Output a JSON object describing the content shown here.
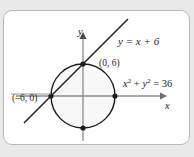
{
  "figure": {
    "kind": "coordinate-plane-diagram",
    "background_color": "#e9e9e9",
    "card_color": "#ffffff",
    "card_border_color": "#b9b9b9",
    "ink_color": "#1c1c1c",
    "axis_color": "#8a8a8a",
    "circle_fill": "#f7f7f7",
    "axes": {
      "x_label": "x",
      "y_label": "y"
    },
    "labels": {
      "line_equation": "y = x + 6",
      "circle_equation_base": "x",
      "circle_equation": "x² + y² = 36",
      "point_top": "(0, 6)",
      "point_left": "(–6, 0)"
    }
  },
  "chart_data": {
    "type": "scatter",
    "title": "",
    "xlabel": "x",
    "ylabel": "y",
    "xlim": [
      -10,
      10
    ],
    "ylim": [
      -9,
      9
    ],
    "grid": false,
    "legend": "none",
    "curves": [
      {
        "name": "circle",
        "equation": "x^2 + y^2 = 36",
        "label": "x² + y² = 36",
        "center": [
          0,
          0
        ],
        "radius": 6,
        "filled": true
      },
      {
        "name": "line",
        "equation": "y = x + 6",
        "label": "y = x + 6",
        "slope": 1,
        "intercept": 6
      }
    ],
    "points": [
      {
        "label": "(0, 6)",
        "x": 0,
        "y": 6,
        "marked": true
      },
      {
        "label": "(–6, 0)",
        "x": -6,
        "y": 0,
        "marked": true
      },
      {
        "label": "",
        "x": 6,
        "y": 0,
        "marked": true
      },
      {
        "label": "",
        "x": 0,
        "y": -6,
        "marked": true
      }
    ],
    "annotations": [
      {
        "text": "y = x + 6",
        "x": 4.2,
        "y": 8.2
      },
      {
        "text": "(0, 6)",
        "x": 1.3,
        "y": 6.6
      },
      {
        "text": "(–6, 0)",
        "x": -9.4,
        "y": 1.1
      },
      {
        "text": "x² + y² = 36",
        "x": 4.6,
        "y": 3.6
      }
    ]
  }
}
